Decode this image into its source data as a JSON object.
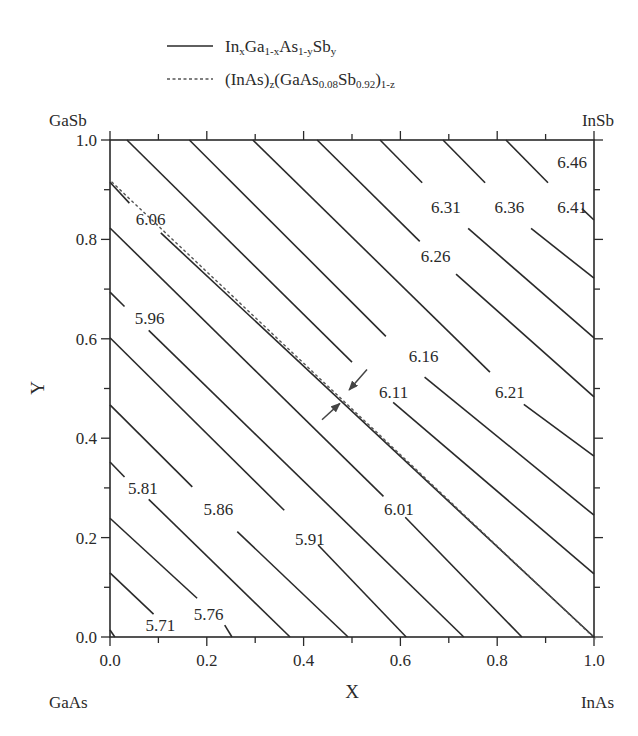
{
  "chart_data": {
    "type": "line",
    "title": "",
    "xlabel": "X",
    "ylabel": "Y",
    "xlim": [
      0.0,
      1.0
    ],
    "ylim": [
      0.0,
      1.0
    ],
    "xticks": [
      "0.0",
      "0.2",
      "0.4",
      "0.6",
      "0.8",
      "1.0"
    ],
    "yticks": [
      "0.0",
      "0.2",
      "0.4",
      "0.6",
      "0.8",
      "1.0"
    ],
    "grid": false,
    "corner_labels": {
      "top_left": "GaSb",
      "top_right": "InSb",
      "bottom_left": "GaAs",
      "bottom_right": "InAs"
    },
    "legend": [
      {
        "style": "solid",
        "text": "InxGa1-xAs1-ySby",
        "parts": [
          [
            "In",
            ""
          ],
          [
            "x",
            "sub"
          ],
          [
            "Ga",
            ""
          ],
          [
            "1-x",
            "sub"
          ],
          [
            "As",
            ""
          ],
          [
            "1-y",
            "sub"
          ],
          [
            "Sb",
            ""
          ],
          [
            "y",
            "sub"
          ]
        ]
      },
      {
        "style": "dashed",
        "text": "(InAs)z(GaAs0.08Sb0.92)1-z",
        "parts": [
          [
            "(InAs)",
            ""
          ],
          [
            "z",
            "sub"
          ],
          [
            "(GaAs",
            ""
          ],
          [
            "0.08",
            "sub"
          ],
          [
            "Sb",
            ""
          ],
          [
            "0.92",
            "sub"
          ],
          [
            ")",
            ""
          ],
          [
            "1-z",
            "sub"
          ]
        ]
      }
    ],
    "series": [
      {
        "name": "corner",
        "label": "",
        "style": "solid",
        "points": [
          [
            0,
            0.014
          ],
          [
            0.01,
            0
          ]
        ]
      },
      {
        "name": "5.71",
        "label": "5.71",
        "style": "solid",
        "points": [
          [
            0,
            0.129
          ],
          [
            0.09,
            0.046
          ]
        ],
        "label_pos": [
          0.104,
          0.024
        ]
      },
      {
        "name": "5.76",
        "label": "5.76",
        "style": "solid",
        "points": [
          [
            0,
            0.239
          ],
          [
            0.18,
            0.078
          ],
          [
            0.237,
            0.024
          ],
          [
            0.252,
            0
          ]
        ],
        "label_pos": [
          0.204,
          0.046
        ]
      },
      {
        "name": "5.81",
        "label": "5.81",
        "style": "solid",
        "points": [
          [
            0,
            0.352
          ],
          [
            0.03,
            0.322
          ],
          [
            0.08,
            0.277
          ],
          [
            0.372,
            0
          ]
        ],
        "label_pos": [
          0.068,
          0.3
        ]
      },
      {
        "name": "5.86",
        "label": "5.86",
        "style": "solid",
        "points": [
          [
            0,
            0.467
          ],
          [
            0.17,
            0.302
          ],
          [
            0.263,
            0.212
          ],
          [
            0.492,
            0
          ]
        ],
        "label_pos": [
          0.224,
          0.257
        ]
      },
      {
        "name": "5.91",
        "label": "5.91",
        "style": "solid",
        "points": [
          [
            0,
            0.602
          ],
          [
            0.36,
            0.255
          ],
          [
            0.43,
            0.185
          ],
          [
            0.612,
            0
          ]
        ],
        "label_pos": [
          0.413,
          0.197
        ]
      },
      {
        "name": "5.96",
        "label": "5.96",
        "style": "solid",
        "points": [
          [
            0,
            0.694
          ],
          [
            0.03,
            0.665
          ],
          [
            0.08,
            0.617
          ],
          [
            0.731,
            0
          ]
        ],
        "label_pos": [
          0.082,
          0.641
        ]
      },
      {
        "name": "6.01",
        "label": "6.01",
        "style": "solid",
        "points": [
          [
            0,
            0.823
          ],
          [
            0.565,
            0.283
          ],
          [
            0.61,
            0.241
          ],
          [
            0.851,
            0
          ]
        ],
        "label_pos": [
          0.597,
          0.258
        ]
      },
      {
        "name": "6.06",
        "label": "6.06",
        "style": "solid",
        "points": [
          [
            0,
            0.915
          ],
          [
            0.04,
            0.873
          ],
          [
            0.105,
            0.813
          ],
          [
            1.0,
            0
          ]
        ],
        "label_pos": [
          0.084,
          0.842
        ]
      },
      {
        "name": "6.11",
        "label": "6.11",
        "style": "solid",
        "points": [
          [
            0.035,
            1.0
          ],
          [
            0.5,
            0.553
          ],
          [
            0.585,
            0.472
          ],
          [
            1.0,
            0.127
          ]
        ],
        "label_pos": [
          0.586,
          0.492
        ]
      },
      {
        "name": "6.16",
        "label": "6.16",
        "style": "solid",
        "points": [
          [
            0.164,
            1.0
          ],
          [
            0.57,
            0.605
          ],
          [
            0.65,
            0.523
          ],
          [
            1.0,
            0.245
          ]
        ],
        "label_pos": [
          0.648,
          0.566
        ]
      },
      {
        "name": "6.21",
        "label": "6.21",
        "style": "solid",
        "points": [
          [
            0.295,
            1.0
          ],
          [
            0.785,
            0.533
          ],
          [
            0.855,
            0.468
          ],
          [
            1.0,
            0.364
          ]
        ],
        "label_pos": [
          0.826,
          0.493
        ]
      },
      {
        "name": "6.26",
        "label": "6.26",
        "style": "solid",
        "points": [
          [
            0.428,
            1.0
          ],
          [
            0.64,
            0.796
          ],
          [
            0.715,
            0.73
          ],
          [
            1.0,
            0.483
          ]
        ],
        "label_pos": [
          0.673,
          0.766
        ]
      },
      {
        "name": "6.31",
        "label": "6.31",
        "style": "solid",
        "points": [
          [
            0.558,
            1.0
          ],
          [
            0.645,
            0.914
          ],
          [
            0.74,
            0.822
          ],
          [
            1.0,
            0.602
          ]
        ],
        "label_pos": [
          0.694,
          0.865
        ]
      },
      {
        "name": "6.36",
        "label": "6.36",
        "style": "solid",
        "points": [
          [
            0.688,
            1.0
          ],
          [
            0.775,
            0.914
          ],
          [
            0.87,
            0.822
          ],
          [
            1.0,
            0.722
          ]
        ],
        "label_pos": [
          0.825,
          0.865
        ]
      },
      {
        "name": "6.41",
        "label": "6.41",
        "style": "solid",
        "points": [
          [
            0.818,
            1.0
          ],
          [
            0.905,
            0.914
          ],
          [
            0.975,
            0.862
          ],
          [
            1.0,
            0.839
          ]
        ],
        "label_pos": [
          0.955,
          0.865
        ]
      },
      {
        "name": "6.46",
        "label": "6.46",
        "style": "none",
        "points": [],
        "label_pos": [
          0.955,
          0.955
        ]
      },
      {
        "name": "(InAs)z(GaAs0.08Sb0.92)1-z",
        "label": "",
        "style": "dashed",
        "points": [
          [
            0,
            0.92
          ],
          [
            1.0,
            0
          ]
        ]
      }
    ],
    "annotations": [
      {
        "type": "arrow",
        "from": [
          0.531,
          0.538
        ],
        "to": [
          0.494,
          0.497
        ]
      },
      {
        "type": "arrow",
        "from": [
          0.438,
          0.437
        ],
        "to": [
          0.475,
          0.47
        ]
      }
    ]
  }
}
